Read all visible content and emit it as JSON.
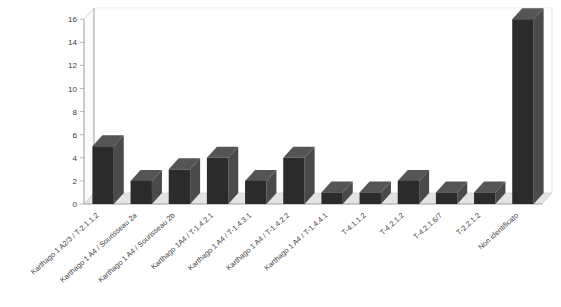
{
  "chart_data": {
    "type": "bar",
    "title": "",
    "subtitle": "",
    "xlabel": "",
    "ylabel": "",
    "ylim": [
      0,
      16
    ],
    "ytick_step": 2,
    "yticks": [
      "0",
      "2",
      "4",
      "6",
      "8",
      "10",
      "12",
      "14",
      "16"
    ],
    "grid": true,
    "legend": "none",
    "style": "3d-column",
    "bar_color": "#2b2b2b",
    "bar_side_color": "#4a4a4a",
    "bar_top_color": "#555555",
    "plot_background": "#ffffff",
    "gridline_color": "#d6d6d6",
    "floor_color": "#e3e3e3",
    "categories": [
      "Karthago 1 A2/3 / T-2.1.1.2",
      "Karthago 1 A4 / Sourisseau 2a",
      "Karthago 1 A4 / Sourisseau 2b",
      "Karthago 1A4 / T-1.4.2.1",
      "Karthago 1 A4 / T-1.4.3.1",
      "Karthago 1 A4 / T-1.4.2.2",
      "Karthago 1 A4 / T-1.4.4.1",
      "T-4.1.1.2",
      "T-4.2.1.2",
      "T-4.2.1.6/7",
      "T-2.2.1.2",
      "Non identificato"
    ],
    "values": [
      5,
      2,
      3,
      4,
      2,
      4,
      1,
      1,
      2,
      1,
      1,
      16
    ]
  }
}
